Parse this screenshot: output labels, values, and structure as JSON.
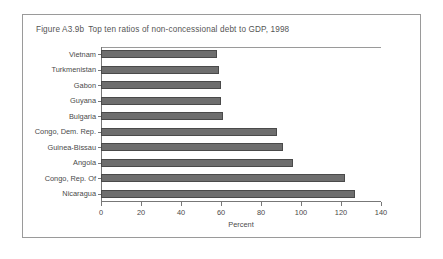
{
  "figure": {
    "number": "Figure A3.9b",
    "title": "Top ten ratios of non-concessional debt to GDP, 1998"
  },
  "chart_data": {
    "type": "bar",
    "orientation": "horizontal",
    "xlabel": "Percent",
    "ylabel": "",
    "xlim": [
      0,
      140
    ],
    "xticks": [
      "0",
      "20",
      "40",
      "60",
      "80",
      "100",
      "120",
      "140"
    ],
    "xtick_values": [
      0,
      20,
      40,
      60,
      80,
      100,
      120,
      140
    ],
    "grid": false,
    "legend": false,
    "bar_color": "#6e6e6e",
    "bar_edge_color": "#4a4a4a",
    "categories": [
      "Vietnam",
      "Turkmenistan",
      "Gabon",
      "Guyana",
      "Bulgaria",
      "Congo, Dem. Rep.",
      "Guinea-Bissau",
      "Angola",
      "Congo, Rep. Of",
      "Nicaragua"
    ],
    "values": [
      58,
      59,
      60,
      60,
      61,
      88,
      91,
      96,
      122,
      127
    ]
  }
}
